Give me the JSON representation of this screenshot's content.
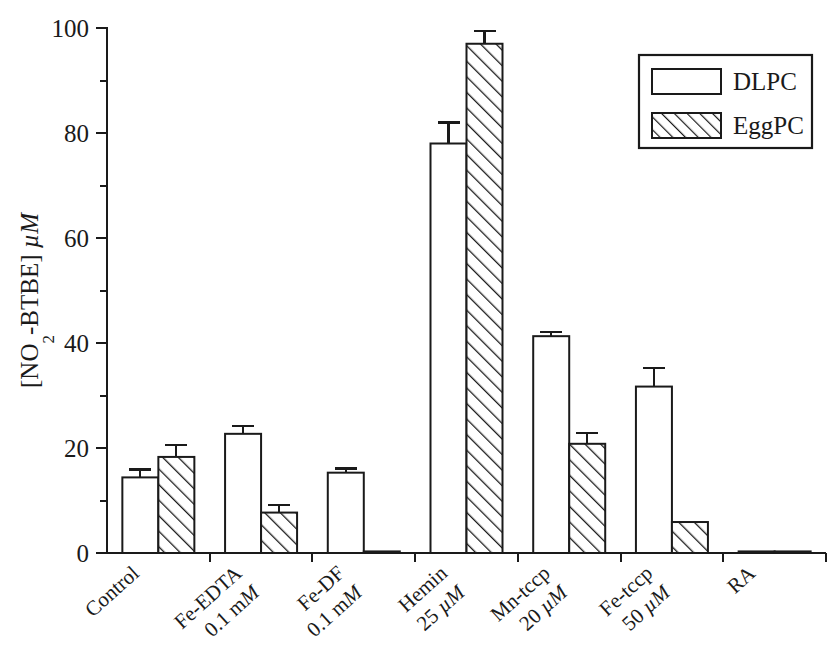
{
  "chart_data": {
    "type": "bar",
    "title": "",
    "subtitle": "",
    "xlabel": "",
    "ylabel": "[NO2-BTBE] µM",
    "ylabel_parts": {
      "prefix": "[NO",
      "subscript": "2",
      "middle": "-BTBE] ",
      "italic_unit": "µM"
    },
    "ylim": [
      0,
      100
    ],
    "yticks": [
      0,
      20,
      40,
      60,
      80,
      100
    ],
    "ytick_labels": [
      "0",
      "20",
      "40",
      "60",
      "80",
      "100"
    ],
    "minor_yticks": [
      10,
      30,
      50,
      70,
      90
    ],
    "grid": false,
    "legend_position": "top-right",
    "categories": [
      "Control",
      "Fe-EDTA 0.1 mM",
      "Fe-DF 0.1 mM",
      "Hemin 25 µM",
      "Mn-tccp 20 µM",
      "Fe-tccp 50 µM",
      "RA"
    ],
    "category_labels": [
      {
        "line1": "Control",
        "line2": "",
        "line2_italic": ""
      },
      {
        "line1": "Fe-EDTA",
        "line2": "0.1 m",
        "line2_italic": "M"
      },
      {
        "line1": "Fe-DF",
        "line2": "0.1 m",
        "line2_italic": "M"
      },
      {
        "line1": "Hemin",
        "line2": "25 ",
        "line2_italic": "µM"
      },
      {
        "line1": "Mn-tccp",
        "line2": "20 ",
        "line2_italic": "µM"
      },
      {
        "line1": "Fe-tccp",
        "line2": "50 ",
        "line2_italic": "µM"
      },
      {
        "line1": "RA",
        "line2": "",
        "line2_italic": ""
      }
    ],
    "series": [
      {
        "name": "DLPC",
        "fill": "open",
        "values": [
          14.4,
          22.7,
          15.3,
          78.0,
          41.3,
          31.7,
          0.3
        ],
        "errors": [
          1.5,
          1.5,
          0.8,
          4.0,
          0.8,
          3.5,
          0.0
        ]
      },
      {
        "name": "EggPC",
        "fill": "hatched",
        "values": [
          18.3,
          7.7,
          0.3,
          97.0,
          20.8,
          5.9,
          0.3
        ],
        "errors": [
          2.2,
          1.5,
          0.0,
          2.5,
          2.0,
          0.0,
          0.0
        ]
      }
    ]
  },
  "legend": {
    "entries": [
      {
        "label": "DLPC",
        "swatch": "open-rectangle"
      },
      {
        "label": "EggPC",
        "swatch": "hatched-rectangle"
      }
    ]
  },
  "colors": {
    "ink": "#1a1a1a",
    "background": "#ffffff",
    "bar_fill_open": "#ffffff"
  }
}
